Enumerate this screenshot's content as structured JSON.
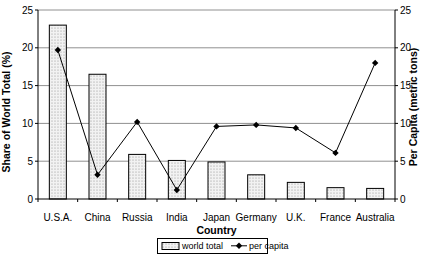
{
  "chart_data": {
    "type": "combo",
    "categories": [
      "U.S.A.",
      "China",
      "Russia",
      "India",
      "Japan",
      "Germany",
      "U.K.",
      "France",
      "Australia"
    ],
    "series": [
      {
        "name": "world total",
        "type": "bar",
        "axis": "left",
        "values": [
          23.0,
          16.5,
          5.9,
          5.1,
          4.9,
          3.2,
          2.2,
          1.5,
          1.4
        ]
      },
      {
        "name": "per capita",
        "type": "line",
        "axis": "right",
        "values": [
          19.7,
          3.2,
          10.2,
          1.2,
          9.6,
          9.8,
          9.4,
          6.1,
          18.0
        ]
      }
    ],
    "title": "",
    "xlabel": "Country",
    "ylabel_left": "Share of World Total (%)",
    "ylabel_right": "Per Capita (metric tons)",
    "ylim_left": [
      0,
      25
    ],
    "ylim_right": [
      0,
      25
    ],
    "ytick_step": 5,
    "grid": true,
    "legend_position": "bottom",
    "colors": {
      "bar_fill_base": "#f2f2f2",
      "bar_dot": "#8c8c8c",
      "bar_border": "#000000",
      "line": "#000000",
      "marker": "#000000",
      "grid": "#909090",
      "axis": "#000000",
      "background": "#ffffff",
      "text": "#000000"
    }
  }
}
